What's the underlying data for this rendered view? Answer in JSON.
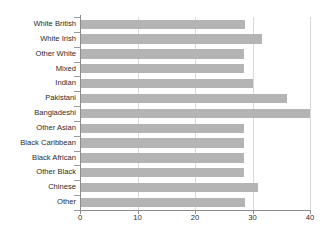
{
  "chart_data": {
    "type": "bar",
    "orientation": "horizontal",
    "title": "",
    "xlabel": "",
    "ylabel": "",
    "xlim": [
      0,
      40
    ],
    "xticks": [
      0,
      10,
      20,
      30,
      40
    ],
    "xtick_labels": [
      "0",
      "10",
      "20",
      "30",
      "40"
    ],
    "grid": true,
    "grid_axis": "x",
    "legend": false,
    "bar_color": "#b4b4b4",
    "axis_color": "#8c8c8c",
    "grid_color": "#d9d9d9",
    "label_color": "#2b2b2b",
    "categories": [
      "White British",
      "White Irish",
      "Other White",
      "Mixed",
      "Indian",
      "Pakistani",
      "Bangladeshi",
      "Other Asian",
      "Black Caribbean",
      "Black African",
      "Other Black",
      "Chinese",
      "Other"
    ],
    "values": [
      28.7,
      31.7,
      28.5,
      28.5,
      30.0,
      36.0,
      40.0,
      28.6,
      28.6,
      28.6,
      28.5,
      31.0,
      28.7
    ]
  }
}
